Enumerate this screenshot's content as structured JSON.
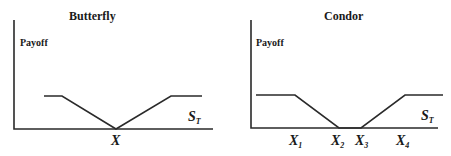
{
  "diagrams": [
    {
      "title": "Butterfly",
      "y_label": "Payoff",
      "x_label": "S",
      "x_label_sub": "T",
      "strikes": [
        {
          "label": "X",
          "sub": ""
        }
      ]
    },
    {
      "title": "Condor",
      "y_label": "Payoff",
      "x_label": "S",
      "x_label_sub": "T",
      "strikes": [
        {
          "label": "X",
          "sub": "1"
        },
        {
          "label": "X",
          "sub": "2"
        },
        {
          "label": "X",
          "sub": "3"
        },
        {
          "label": "X",
          "sub": "4"
        }
      ]
    }
  ],
  "colors": {
    "line": "#2a2a2a",
    "text": "#1a1a1a",
    "background": "#ffffff"
  }
}
